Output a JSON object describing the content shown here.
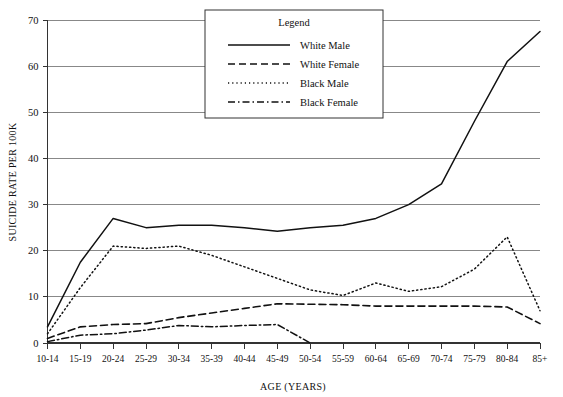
{
  "chart_data": {
    "type": "line",
    "title": "",
    "xlabel": "AGE (YEARS)",
    "ylabel": "SUICIDE RATE PER 100K",
    "categories": [
      "10-14",
      "15-19",
      "20-24",
      "25-29",
      "30-34",
      "35-39",
      "40-44",
      "45-49",
      "50-54",
      "55-59",
      "60-64",
      "65-69",
      "70-74",
      "75-79",
      "80-84",
      "85+"
    ],
    "ylim": [
      0,
      70
    ],
    "yticks": [
      0,
      10,
      20,
      30,
      40,
      50,
      60,
      70
    ],
    "grid": "horizontal",
    "legend_position": "top-center",
    "legend_title": "Legend",
    "series": [
      {
        "name": "White Male",
        "style": "solid",
        "values": [
          3.5,
          17.5,
          27.0,
          25.0,
          25.5,
          25.5,
          25.0,
          24.2,
          25.0,
          25.5,
          27.0,
          30.0,
          34.5,
          48.0,
          61.0,
          67.5
        ]
      },
      {
        "name": "White Female",
        "style": "dashed",
        "values": [
          1.0,
          3.5,
          4.0,
          4.2,
          5.5,
          6.5,
          7.5,
          8.5,
          8.4,
          8.3,
          8.0,
          8.0,
          8.0,
          8.0,
          7.8,
          4.2
        ]
      },
      {
        "name": "Black Male",
        "style": "dotted",
        "values": [
          2.0,
          12.0,
          21.0,
          20.5,
          21.0,
          19.0,
          16.5,
          14.0,
          11.5,
          10.3,
          13.0,
          11.2,
          12.2,
          16.0,
          23.0,
          7.0
        ]
      },
      {
        "name": "Black Female",
        "style": "dash-dot",
        "values": [
          0.3,
          1.7,
          2.0,
          2.8,
          3.8,
          3.5,
          3.8,
          4.0,
          0.0,
          null,
          null,
          null,
          null,
          null,
          null,
          null
        ]
      }
    ]
  },
  "axes": {
    "y_title": "SUICIDE RATE PER 100K",
    "x_title": "AGE (YEARS)",
    "y_tick_labels": [
      "0",
      "10",
      "20",
      "30",
      "40",
      "50",
      "60",
      "70"
    ],
    "x_tick_labels": [
      "10-14",
      "15-19",
      "20-24",
      "25-29",
      "30-34",
      "35-39",
      "40-44",
      "45-49",
      "50-54",
      "55-59",
      "60-64",
      "65-69",
      "70-74",
      "75-79",
      "80-84",
      "85+"
    ]
  },
  "legend": {
    "title": "Legend",
    "entries": [
      {
        "label": "White Male",
        "style": "solid"
      },
      {
        "label": "White Female",
        "style": "dashed"
      },
      {
        "label": "Black Male",
        "style": "dotted"
      },
      {
        "label": "Black Female",
        "style": "dash-dot"
      }
    ]
  },
  "colors": {
    "ink": "#111111",
    "grid": "#888888",
    "axis": "#333333",
    "background": "#ffffff"
  }
}
